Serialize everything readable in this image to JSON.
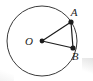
{
  "figure": {
    "kind": "circle-geometry-diagram",
    "width": 93,
    "height": 81,
    "background_color": "#ffffff",
    "stroke_color": "#1c1c1c",
    "circle_stroke_color": "#3a3a3a",
    "label_color": "#1c1c1c",
    "circle": {
      "center_label": "O",
      "cx": 42,
      "cy": 41,
      "r": 35,
      "stroke_width": 1
    },
    "points": [
      {
        "label": "O",
        "x": 42,
        "y": 41,
        "dot": true,
        "dot_r": 2.4,
        "label_x": 29,
        "label_y": 45
      },
      {
        "label": "A",
        "x": 71,
        "y": 22,
        "dot": true,
        "dot_r": 2.6,
        "label_x": 74,
        "label_y": 16
      },
      {
        "label": "B",
        "x": 73,
        "y": 48,
        "dot": true,
        "dot_r": 2.6,
        "label_x": 75,
        "label_y": 60
      }
    ],
    "segments": [
      {
        "name": "radius-OA",
        "from": "O",
        "to": "A",
        "x1": 42,
        "y1": 41,
        "x2": 71,
        "y2": 22,
        "stroke_width": 1.2
      },
      {
        "name": "radius-OB",
        "from": "O",
        "to": "B",
        "x1": 42,
        "y1": 41,
        "x2": 73,
        "y2": 48,
        "stroke_width": 1.2
      },
      {
        "name": "chord-AB",
        "from": "A",
        "to": "B",
        "x1": 71,
        "y1": 22,
        "x2": 73,
        "y2": 48,
        "stroke_width": 1.2
      }
    ]
  }
}
